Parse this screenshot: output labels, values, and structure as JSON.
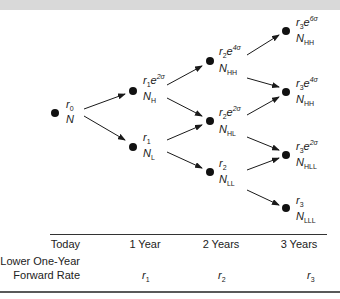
{
  "diagram": {
    "nodes": [
      {
        "id": "root",
        "rate": {
          "base": "r",
          "sub": "0",
          "exp": ""
        },
        "value": {
          "base": "N",
          "sub": ""
        }
      },
      {
        "id": "H",
        "rate": {
          "base": "r",
          "sub": "1",
          "exp": "2σ"
        },
        "value": {
          "base": "N",
          "sub": "H"
        }
      },
      {
        "id": "L",
        "rate": {
          "base": "r",
          "sub": "1",
          "exp": ""
        },
        "value": {
          "base": "N",
          "sub": "L"
        }
      },
      {
        "id": "HH",
        "rate": {
          "base": "r",
          "sub": "2",
          "exp": "4σ"
        },
        "value": {
          "base": "N",
          "sub": "HH"
        }
      },
      {
        "id": "HL",
        "rate": {
          "base": "r",
          "sub": "2",
          "exp": "2σ"
        },
        "value": {
          "base": "N",
          "sub": "HL"
        }
      },
      {
        "id": "LL",
        "rate": {
          "base": "r",
          "sub": "2",
          "exp": ""
        },
        "value": {
          "base": "N",
          "sub": "LL"
        }
      },
      {
        "id": "HHH",
        "rate": {
          "base": "r",
          "sub": "3",
          "exp": "6σ"
        },
        "value": {
          "base": "N",
          "sub": "HH"
        }
      },
      {
        "id": "HHL",
        "rate": {
          "base": "r",
          "sub": "3",
          "exp": "4σ"
        },
        "value": {
          "base": "N",
          "sub": "HH"
        }
      },
      {
        "id": "HLL",
        "rate": {
          "base": "r",
          "sub": "3",
          "exp": "2σ"
        },
        "value": {
          "base": "N",
          "sub": "HLL"
        }
      },
      {
        "id": "LLL",
        "rate": {
          "base": "r",
          "sub": "3",
          "exp": ""
        },
        "value": {
          "base": "N",
          "sub": "LLL"
        }
      }
    ],
    "exp_base": "e"
  },
  "timeline": {
    "periods": [
      "Today",
      "1 Year",
      "2 Years",
      "3 Years"
    ],
    "row_label_line1": "Lower One-Year",
    "row_label_line2": "Forward Rate",
    "forward_rates": [
      {
        "base": "r",
        "sub": "1"
      },
      {
        "base": "r",
        "sub": "2"
      },
      {
        "base": "r",
        "sub": "3"
      }
    ]
  },
  "colors": {
    "ink": "#1a1a1a",
    "topbar": "#d9d9d9"
  }
}
